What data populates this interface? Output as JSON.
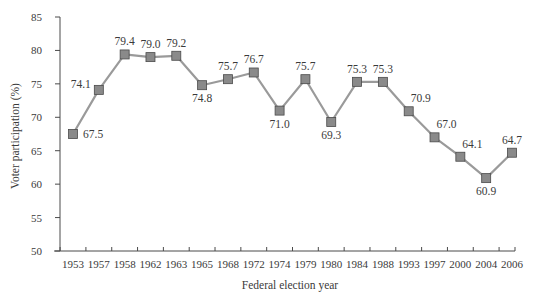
{
  "chart_data": {
    "type": "line",
    "title": "",
    "xlabel": "Federal election year",
    "ylabel": "Voter participation (%)",
    "ylim": [
      50,
      85
    ],
    "yticks": [
      50,
      55,
      60,
      65,
      70,
      75,
      80,
      85
    ],
    "grid": false,
    "legend": null,
    "categories": [
      "1953",
      "1957",
      "1958",
      "1962",
      "1963",
      "1965",
      "1968",
      "1972",
      "1974",
      "1979",
      "1980",
      "1984",
      "1988",
      "1993",
      "1997",
      "2000",
      "2004",
      "2006"
    ],
    "series": [
      {
        "name": "Voter participation",
        "values": [
          67.5,
          74.1,
          79.4,
          79.0,
          79.2,
          74.8,
          75.7,
          76.7,
          71.0,
          75.7,
          69.3,
          75.3,
          75.3,
          70.9,
          67.0,
          64.1,
          60.9,
          64.7
        ],
        "labels": [
          "67.5",
          "74.1",
          "79.4",
          "79.0",
          "79.2",
          "74.8",
          "75.7",
          "76.7",
          "71.0",
          "75.7",
          "69.3",
          "75.3",
          "75.3",
          "70.9",
          "67.0",
          "64.1",
          "60.9",
          "64.7"
        ],
        "label_pos": [
          "right",
          "left",
          "above",
          "above",
          "above",
          "below",
          "above",
          "above",
          "below",
          "above",
          "below",
          "above",
          "above",
          "above-right",
          "above-right",
          "above-right",
          "below",
          "above"
        ]
      }
    ],
    "colors": {
      "line": "#9a9a9a",
      "marker_fill": "#8a8a8a",
      "marker_stroke": "#4a4a4a",
      "axis": "#4a4a4a",
      "text": "#3a3a3a"
    }
  }
}
